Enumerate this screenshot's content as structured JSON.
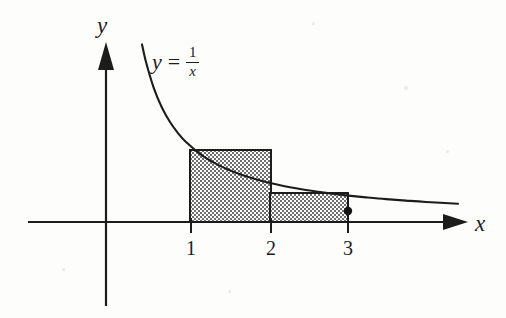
{
  "figure": {
    "background_color": "#fdfdfc",
    "ink_color": "#1c1c1c"
  },
  "axes": {
    "x_label": "x",
    "y_label": "y",
    "x_tick_labels": [
      "1",
      "2",
      "3"
    ],
    "origin_px": {
      "x": 106,
      "y": 222
    },
    "unit_px": 80,
    "x_axis_start_px": 28,
    "x_axis_end_px": 466,
    "y_axis_top_px": 42,
    "y_axis_bottom_px": 306
  },
  "curve": {
    "equation_lhs": "y",
    "equation_relation": "=",
    "equation_numerator": "1",
    "equation_denominator": "x",
    "label_text": "y = 1/x",
    "stroke_color": "#1c1c1c",
    "stroke_width": 2.1
  },
  "marker": {
    "name": "point-on-curve",
    "x_value": 3,
    "y_value": 0.3333,
    "px": {
      "x": 348,
      "y": 211
    },
    "radius_px": 4.2,
    "fill": "#141414"
  },
  "rectangles": [
    {
      "name": "rectangle-1",
      "x_from": 1,
      "x_to": 2,
      "height_value": 1,
      "px": {
        "x": 190,
        "y": 150,
        "width": 81,
        "height": 72
      },
      "fill": "#b3b3b3",
      "stroke": "#1c1c1c"
    },
    {
      "name": "rectangle-2",
      "x_from": 2,
      "x_to": 3,
      "height_value": 0.5,
      "px": {
        "x": 270,
        "y": 193,
        "width": 78,
        "height": 29
      },
      "fill": "#b3b3b3",
      "stroke": "#1c1c1c"
    }
  ],
  "chart_data": {
    "type": "line",
    "xlabel": "x",
    "ylabel": "y",
    "xlim": [
      -1,
      4.5
    ],
    "ylim": [
      -1,
      2.3
    ],
    "grid": false,
    "legend": "none",
    "series": [
      {
        "name": "y = 1/x",
        "x": [
          0.45,
          0.5,
          0.6,
          0.7,
          0.8,
          0.9,
          1.0,
          1.2,
          1.4,
          1.6,
          1.8,
          2.0,
          2.25,
          2.5,
          2.75,
          3.0,
          3.25,
          3.5,
          3.75,
          4.0,
          4.4
        ],
        "y": [
          2.22,
          2.0,
          1.667,
          1.429,
          1.25,
          1.111,
          1.0,
          0.833,
          0.714,
          0.625,
          0.556,
          0.5,
          0.444,
          0.4,
          0.364,
          0.333,
          0.308,
          0.286,
          0.267,
          0.25,
          0.227
        ]
      }
    ],
    "bars": {
      "name": "Right-endpoint rectangles (lower sum)",
      "categories": [
        "[1,2]",
        "[2,3]"
      ],
      "values": [
        1.0,
        0.5
      ],
      "fill": "#b3b3b3",
      "hatch": "dotted-checker"
    },
    "annotations": [
      {
        "text": "y = 1/x",
        "x": 1.0,
        "y": 1.95
      },
      {
        "text": "point (3, 1/3)",
        "x": 3.0,
        "y": 0.3333
      }
    ],
    "xticks": [
      1,
      2,
      3
    ],
    "xticklabels": [
      "1",
      "2",
      "3"
    ],
    "yticks": [],
    "yticklabels": []
  }
}
